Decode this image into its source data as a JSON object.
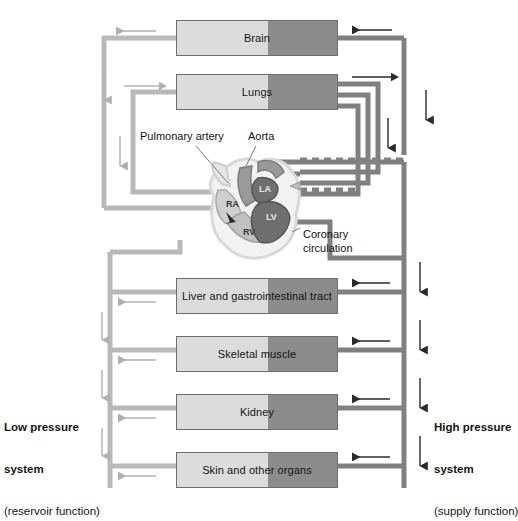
{
  "figure": {
    "type": "physiology-flow-diagram"
  },
  "colors": {
    "oxygen_poor_vessel": "#b9b9b9",
    "oxygen_rich_vessel": "#808080",
    "box_light_half": "#dcdcdc",
    "box_dark_half": "#8c8c8c",
    "box_border": "#6e6e6e",
    "text": "#141414",
    "heart_outline": "#d9d9d9",
    "heart_dark_chamber": "#6f6f6f",
    "heart_mid_chamber": "#9a9a9a",
    "heart_light_chamber": "#cfcfcf"
  },
  "organs": [
    {
      "id": "brain",
      "label": "Brain",
      "x": 176,
      "y": 20,
      "w": 162,
      "h": 36
    },
    {
      "id": "lungs",
      "label": "Lungs",
      "x": 176,
      "y": 74,
      "w": 162,
      "h": 36
    },
    {
      "id": "liver",
      "label": "Liver and gastrointestinal tract",
      "x": 176,
      "y": 278,
      "w": 162,
      "h": 36
    },
    {
      "id": "muscle",
      "label": "Skeletal muscle",
      "x": 176,
      "y": 336,
      "w": 162,
      "h": 36
    },
    {
      "id": "kidney",
      "label": "Kidney",
      "x": 176,
      "y": 394,
      "w": 162,
      "h": 36
    },
    {
      "id": "skin",
      "label": "Skin and other organs",
      "x": 176,
      "y": 452,
      "w": 162,
      "h": 36
    }
  ],
  "callouts": {
    "pulmonary_artery": "Pulmonary artery",
    "aorta": "Aorta",
    "coronary_line1": "Coronary",
    "coronary_line2": "circulation"
  },
  "heart_chambers": [
    {
      "id": "ra",
      "label": "RA",
      "x": 226,
      "y": 199
    },
    {
      "id": "rv",
      "label": "RV",
      "x": 243,
      "y": 227
    },
    {
      "id": "la",
      "label": "LA",
      "x": 265,
      "y": 189
    },
    {
      "id": "lv",
      "label": "LV",
      "x": 272,
      "y": 216
    }
  ],
  "side_labels": {
    "left": {
      "line1": "Low pressure",
      "line2": "system",
      "line3": "(reservoir function)"
    },
    "right": {
      "line1": "High pressure",
      "line2": "system",
      "line3": "(supply function)"
    }
  },
  "flow_arrows": {
    "venous_return_direction": "left-and-up toward right heart",
    "arterial_supply_direction": "down-and-left toward organs",
    "count_left_small_arrows": 6,
    "count_right_small_arrows": 6
  }
}
